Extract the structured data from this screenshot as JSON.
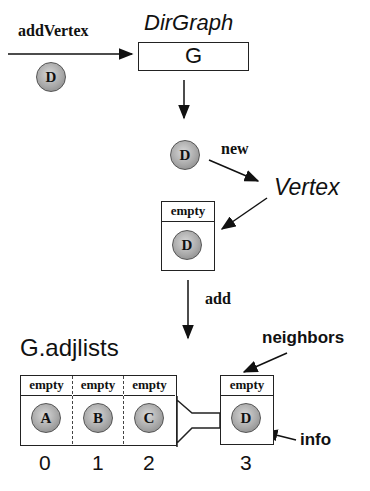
{
  "labels": {
    "add_vertex": "addVertex",
    "dirgraph_type": "DirGraph",
    "graph_var": "G",
    "new_op": "new",
    "vertex_type": "Vertex",
    "add_op": "add",
    "adjlists": "G.adjlists",
    "neighbors": "neighbors",
    "info": "info"
  },
  "incoming_vertex": {
    "label": "D"
  },
  "new_vertex": {
    "label": "D"
  },
  "created_vertex": {
    "header": "empty",
    "label": "D"
  },
  "adjlists": {
    "cells": [
      {
        "header": "empty",
        "label": "A",
        "index": "0"
      },
      {
        "header": "empty",
        "label": "B",
        "index": "1"
      },
      {
        "header": "empty",
        "label": "C",
        "index": "2"
      }
    ],
    "appended": {
      "header": "empty",
      "label": "D",
      "index": "3"
    }
  }
}
